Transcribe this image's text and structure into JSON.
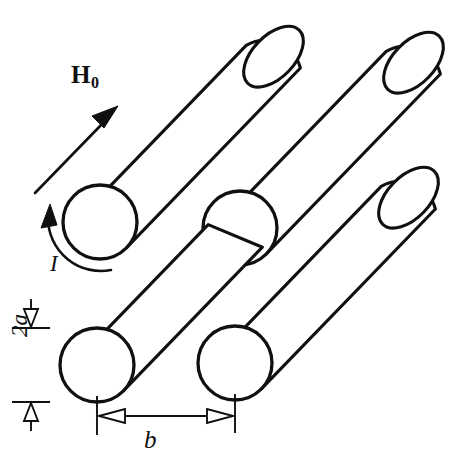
{
  "figure": {
    "background_color": "#ffffff",
    "ink_color": "#101010",
    "width": 462,
    "height": 464
  },
  "labels": {
    "field_symbol": "H",
    "field_subscript": "0",
    "current_symbol": "I",
    "diameter_symbol": "2a",
    "spacing_symbol": "b"
  },
  "annotations": {
    "field_arrow": {
      "name": "applied-field-arrow",
      "direction": "up-right",
      "angle_deg": -46
    },
    "current_arc": {
      "name": "current-direction-arc",
      "sense": "counterclockwise"
    },
    "diameter_dimension": {
      "name": "cylinder-diameter-dimension",
      "orientation": "vertical",
      "arrowheads": "open-triangle"
    },
    "spacing_dimension": {
      "name": "center-spacing-dimension",
      "orientation": "horizontal",
      "arrowheads": "open-triangle-double"
    }
  },
  "geometry": {
    "cylinder_axis_angle_deg": -46,
    "circle_radius": 37,
    "cylinders": [
      {
        "id": "cyl-top-left",
        "near_center_x": 100,
        "near_center_y": 222,
        "length": 250,
        "has_end_cap": true
      },
      {
        "id": "cyl-top-right",
        "near_center_x": 240,
        "near_center_y": 228,
        "length": 250,
        "has_end_cap": true
      },
      {
        "id": "cyl-bottom-left",
        "near_center_x": 97,
        "near_center_y": 365,
        "length": 250,
        "has_end_cap": false
      },
      {
        "id": "cyl-bottom-right",
        "near_center_x": 235,
        "near_center_y": 363,
        "length": 250,
        "has_end_cap": true
      }
    ]
  }
}
